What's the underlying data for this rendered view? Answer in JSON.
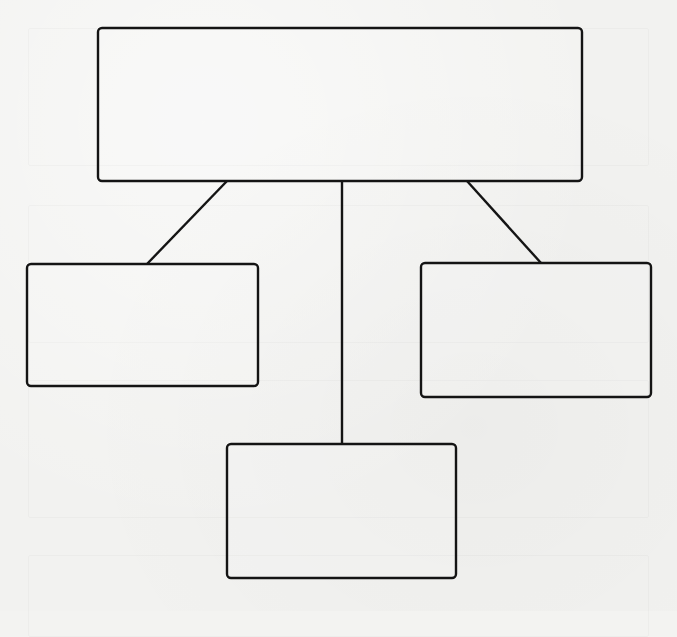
{
  "diagram": {
    "type": "hierarchy",
    "background_color": "#f2f2f0",
    "stroke_color": "#141414",
    "nodes": [
      {
        "id": "root",
        "label": "",
        "x": 98,
        "y": 28,
        "width": 484,
        "height": 153
      },
      {
        "id": "left-child",
        "label": "",
        "x": 27,
        "y": 264,
        "width": 231,
        "height": 122
      },
      {
        "id": "center-child",
        "label": "",
        "x": 227,
        "y": 444,
        "width": 229,
        "height": 134
      },
      {
        "id": "right-child",
        "label": "",
        "x": 421,
        "y": 263,
        "width": 230,
        "height": 134
      }
    ],
    "edges": [
      {
        "from": "root",
        "to": "left-child",
        "x1": 227,
        "y1": 181,
        "x2": 147,
        "y2": 264
      },
      {
        "from": "root",
        "to": "center-child",
        "x1": 342,
        "y1": 181,
        "x2": 342,
        "y2": 444
      },
      {
        "from": "root",
        "to": "right-child",
        "x1": 467,
        "y1": 181,
        "x2": 541,
        "y2": 263
      }
    ]
  }
}
